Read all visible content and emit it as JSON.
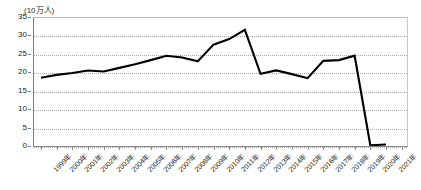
{
  "chart_data": {
    "type": "line",
    "title": "",
    "subtitle": "",
    "unit_label": "(10万人)",
    "xlabel": "",
    "ylabel": "",
    "ylim": [
      0,
      35
    ],
    "y_ticks": [
      0,
      5,
      10,
      15,
      20,
      25,
      30,
      35
    ],
    "grid": true,
    "legend": "none",
    "categories": [
      "1999年",
      "2000年",
      "2001年",
      "2002年",
      "2003年",
      "2004年",
      "2005年",
      "2006年",
      "2007年",
      "2008年",
      "2009年",
      "2010年",
      "2011年",
      "2012年",
      "2013年",
      "2014年",
      "2015年",
      "2016年",
      "2017年",
      "2018年",
      "2019年",
      "2020年",
      "2021年"
    ],
    "values": [
      18.5,
      19.3,
      19.8,
      20.5,
      20.2,
      21.2,
      22.2,
      23.3,
      24.5,
      24.0,
      23.0,
      27.5,
      29.0,
      31.5,
      19.6,
      20.5,
      19.5,
      18.4,
      23.1,
      23.3,
      24.5,
      0.2,
      0.4
    ],
    "series_color": "#000000",
    "series_name": ""
  },
  "axis": {
    "y_tick_labels": [
      "0",
      "5",
      "10",
      "15",
      "20",
      "25",
      "30",
      "35"
    ]
  }
}
